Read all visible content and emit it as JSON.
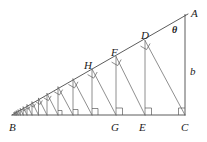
{
  "figure": {
    "type": "geometry-diagram",
    "background_color": "#ffffff",
    "stroke_color": "#4a4a4a",
    "label_color": "#1a1a1a",
    "labels": [
      {
        "id": "A",
        "text": "A",
        "x": 191,
        "y": 8,
        "kind": "vertex"
      },
      {
        "id": "theta",
        "text": "θ",
        "x": 172,
        "y": 25,
        "kind": "angle"
      },
      {
        "id": "b",
        "text": "b",
        "x": 190,
        "y": 66,
        "kind": "side-length"
      },
      {
        "id": "D",
        "text": "D",
        "x": 141,
        "y": 30,
        "kind": "vertex"
      },
      {
        "id": "F",
        "text": "F",
        "x": 111,
        "y": 47,
        "kind": "vertex"
      },
      {
        "id": "H",
        "text": "H",
        "x": 84,
        "y": 60,
        "kind": "vertex"
      },
      {
        "id": "B",
        "text": "B",
        "x": 9,
        "y": 122,
        "kind": "vertex"
      },
      {
        "id": "G",
        "text": "G",
        "x": 111,
        "y": 122,
        "kind": "vertex"
      },
      {
        "id": "E",
        "text": "E",
        "x": 139,
        "y": 122,
        "kind": "vertex"
      },
      {
        "id": "C",
        "text": "C",
        "x": 181,
        "y": 122,
        "kind": "vertex"
      }
    ],
    "triangle": {
      "apex_A": {
        "x": 188,
        "y": 14
      },
      "base_B": {
        "x": 12,
        "y": 115
      },
      "corner_C": {
        "x": 185,
        "y": 115
      }
    },
    "base_feet_x": [
      185,
      143,
      116,
      92,
      73,
      58,
      47,
      38,
      31,
      26,
      22,
      19,
      17,
      15
    ],
    "right_angle_marks": 10,
    "spiral_segments": 14
  }
}
